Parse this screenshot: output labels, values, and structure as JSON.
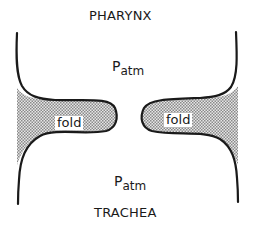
{
  "diagram": {
    "top_label": "PHARYNX",
    "bottom_label": "TRACHEA",
    "upper_pressure": {
      "symbol": "P",
      "subscript": "atm"
    },
    "lower_pressure": {
      "symbol": "P",
      "subscript": "atm"
    },
    "left_fold_label": "fold",
    "right_fold_label": "fold",
    "colors": {
      "outline": "#1a1a1a",
      "fold_fill": "#bdbdbd",
      "background": "#ffffff"
    }
  }
}
